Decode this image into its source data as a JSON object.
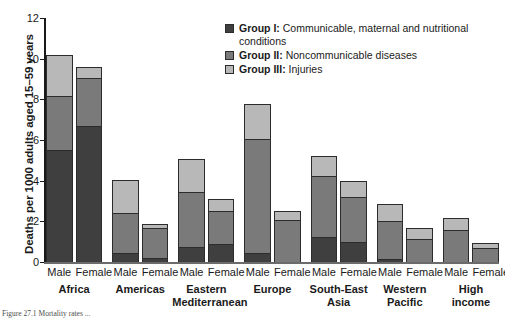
{
  "chart_data": {
    "type": "bar",
    "stacked": true,
    "title": "",
    "xlabel": "",
    "ylabel": "Deaths per 1000 adults aged 15–59 years",
    "ylim": [
      0,
      12
    ],
    "yticks": [
      0,
      2,
      4,
      6,
      8,
      10,
      12
    ],
    "grid": false,
    "legend_position": "top-right",
    "categories": [
      "Africa Male",
      "Africa Female",
      "Americas Male",
      "Americas Female",
      "Eastern Mediterranean Male",
      "Eastern Mediterranean Female",
      "Europe Male",
      "Europe Female",
      "South-East Asia Male",
      "South-East Asia Female",
      "Western Pacific Male",
      "Western Pacific Female",
      "High income Male",
      "High income Female"
    ],
    "groups": [
      {
        "name": "Africa",
        "lines": [
          "Africa"
        ]
      },
      {
        "name": "Americas",
        "lines": [
          "Americas"
        ]
      },
      {
        "name": "Eastern Mediterranean",
        "lines": [
          "Eastern",
          "Mediterranean"
        ]
      },
      {
        "name": "Europe",
        "lines": [
          "Europe"
        ]
      },
      {
        "name": "South-East Asia",
        "lines": [
          "South-East",
          "Asia"
        ]
      },
      {
        "name": "Western Pacific",
        "lines": [
          "Western",
          "Pacific"
        ]
      },
      {
        "name": "High income",
        "lines": [
          "High",
          "income"
        ]
      }
    ],
    "sexes": [
      "Male",
      "Female"
    ],
    "series": [
      {
        "name": "Group I",
        "color": "#3f3f3f",
        "values": [
          5.5,
          6.7,
          0.45,
          0.2,
          0.75,
          0.9,
          0.45,
          -0.05,
          1.25,
          1.0,
          0.15,
          -0.05,
          -0.05,
          -0.05
        ]
      },
      {
        "name": "Group II",
        "color": "#7a7a7a",
        "values": [
          2.65,
          2.35,
          1.95,
          1.45,
          2.7,
          1.6,
          5.6,
          2.05,
          3.0,
          2.2,
          1.85,
          1.15,
          1.55,
          0.7
        ]
      },
      {
        "name": "Group III",
        "color": "#b8b8b8",
        "values": [
          2.05,
          0.55,
          1.65,
          0.2,
          1.6,
          0.6,
          1.7,
          0.45,
          0.95,
          0.8,
          0.85,
          0.5,
          0.6,
          0.25
        ]
      }
    ],
    "totals": [
      10.2,
      9.6,
      4.05,
      1.85,
      5.05,
      3.1,
      7.75,
      2.5,
      5.2,
      4.0,
      2.85,
      1.6,
      2.15,
      0.9
    ]
  },
  "legend": {
    "items": [
      {
        "label": "Group I:",
        "text": "Communicable, maternal and nutritional conditions",
        "color": "#3f3f3f"
      },
      {
        "label": "Group II:",
        "text": "Noncommunicable diseases",
        "color": "#7a7a7a"
      },
      {
        "label": "Group III:",
        "text": "Injuries",
        "color": "#b8b8b8"
      }
    ]
  },
  "caption": "Figure 27.1  Mortality rates ..."
}
